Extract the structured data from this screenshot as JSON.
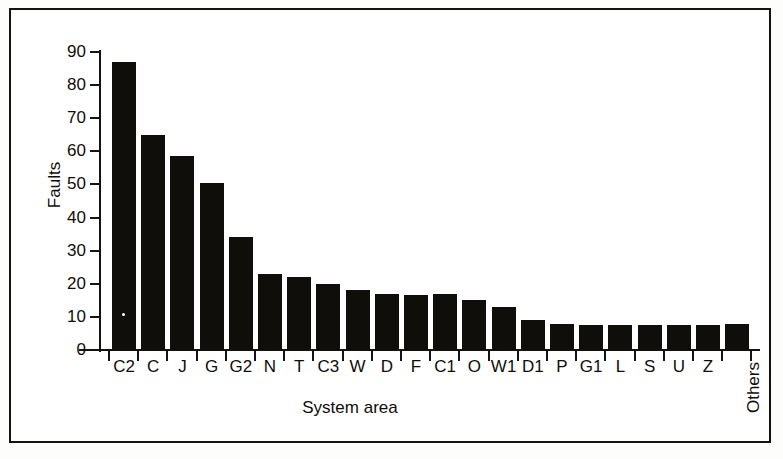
{
  "chart_data": {
    "type": "bar",
    "title": "",
    "xlabel": "System area",
    "ylabel": "Faults",
    "ylim": [
      0,
      90
    ],
    "y_ticks": [
      0,
      10,
      20,
      30,
      40,
      50,
      60,
      70,
      80,
      90
    ],
    "grid": false,
    "legend": "none",
    "orientation": "vertical",
    "bar_color": "#100e0b",
    "categories": [
      "C2",
      "C",
      "J",
      "G",
      "G2",
      "N",
      "T",
      "C3",
      "W",
      "D",
      "F",
      "C1",
      "O",
      "W1",
      "D1",
      "P",
      "G1",
      "L",
      "S",
      "U",
      "Z",
      "Others"
    ],
    "values": [
      87,
      65,
      58.5,
      50.5,
      34,
      23,
      22,
      20,
      18,
      17,
      16.5,
      17,
      15,
      13,
      9,
      8,
      7.5,
      7.5,
      7.5,
      7.5,
      7.5,
      8
    ]
  },
  "axes": {
    "y_title": "Faults",
    "x_title": "System area"
  }
}
